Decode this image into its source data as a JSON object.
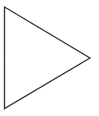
{
  "diagram": {
    "shape": "triangle",
    "orientation": "right-pointing",
    "fill": "#ffffff",
    "stroke": "#333333",
    "stroke_width": 1.3,
    "vertices": [
      {
        "x": 4.5,
        "y": 7
      },
      {
        "x": 90,
        "y": 58
      },
      {
        "x": 4.5,
        "y": 108.5
      }
    ]
  },
  "background": "#ffffff"
}
